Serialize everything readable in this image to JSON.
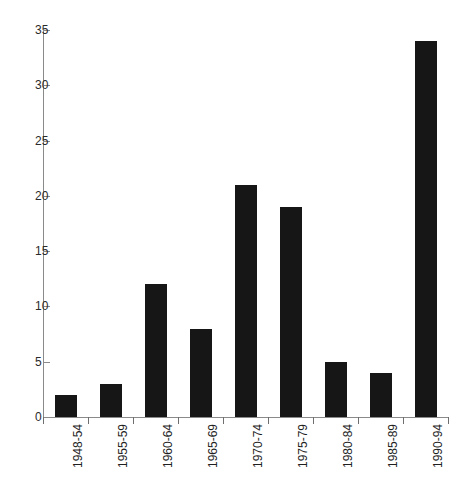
{
  "chart_data": {
    "type": "bar",
    "title": "",
    "subtitle": "",
    "xlabel": "",
    "ylabel": "",
    "categories": [
      "1948-54",
      "1955-59",
      "1960-64",
      "1965-69",
      "1970-74",
      "1975-79",
      "1980-84",
      "1985-89",
      "1990-94"
    ],
    "values": [
      2,
      3,
      12,
      8,
      21,
      19,
      5,
      4,
      34
    ],
    "ylim": [
      0,
      35
    ],
    "yticks": [
      0,
      5,
      10,
      15,
      20,
      25,
      30,
      35
    ],
    "ytick_labels": [
      "0",
      "5",
      "10",
      "15",
      "20",
      "25",
      "30",
      "35"
    ],
    "grid": false,
    "legend": null,
    "legend_position": "none",
    "annotations": [],
    "bar_color": "#161616",
    "axis_color": "#8a8a8a",
    "background_color": "#ffffff",
    "xtick_label_rotation": -90
  }
}
